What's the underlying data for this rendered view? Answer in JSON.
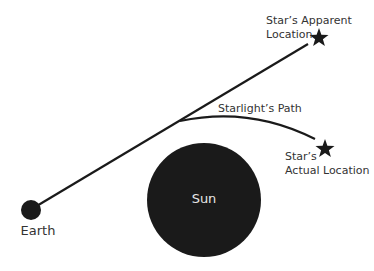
{
  "diagram": {
    "labels": {
      "apparent_line1": "Star’s Apparent",
      "apparent_line2": "Location",
      "path": "Starlight’s Path",
      "actual_line1": "Star’s",
      "actual_line2": "Actual Location",
      "sun": "Sun",
      "earth": "Earth"
    },
    "colors": {
      "ink": "#1a1a1a",
      "text": "#333333",
      "sun_text": "#e6e6e6",
      "background": "#ffffff"
    }
  }
}
